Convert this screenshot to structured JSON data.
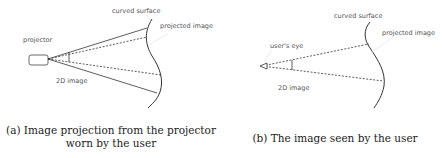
{
  "panel_a": {
    "labels": {
      "projector": "projector",
      "curved_surface": "curved surface",
      "projected_image": "projected image",
      "image_2d": "2D image"
    },
    "caption_line1": "(a) Image projection from the projector",
    "caption_line2": "worn by the user"
  },
  "panel_b": {
    "labels": {
      "users_eye": "user's eye",
      "curved_surface": "curved surface",
      "projected_image": "projected image",
      "image_2d": "2D image"
    },
    "caption": "(b) The image seen by the user"
  },
  "colors": {
    "line": "#333333",
    "label_text": "#555555",
    "leader": "#dddddd"
  }
}
